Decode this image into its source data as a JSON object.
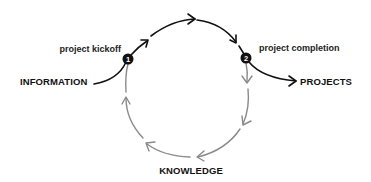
{
  "diagram": {
    "title": "",
    "nodes": {
      "information": {
        "label": "INFORMATION"
      },
      "projects": {
        "label": "PROJECTS"
      },
      "knowledge": {
        "label": "KNOWLEDGE"
      }
    },
    "markers": [
      {
        "number": "1",
        "label": "project kickoff"
      },
      {
        "number": "2",
        "label": "project completion"
      }
    ],
    "colors": {
      "primary_arrow": "#111111",
      "cycle_arrow": "#8a8a8a",
      "marker_fill": "#111111",
      "text": "#111111",
      "background": "#ffffff"
    },
    "flow": [
      {
        "from": "INFORMATION",
        "to": "marker 1",
        "style": "black"
      },
      {
        "from": "marker 1",
        "to": "marker 2",
        "style": "black",
        "path": "upper arc"
      },
      {
        "from": "marker 2",
        "to": "PROJECTS",
        "style": "black"
      },
      {
        "from": "marker 2",
        "to": "KNOWLEDGE",
        "style": "gray",
        "path": "lower-right arc"
      },
      {
        "from": "KNOWLEDGE",
        "to": "marker 1",
        "style": "gray",
        "path": "lower-left arc"
      }
    ]
  }
}
